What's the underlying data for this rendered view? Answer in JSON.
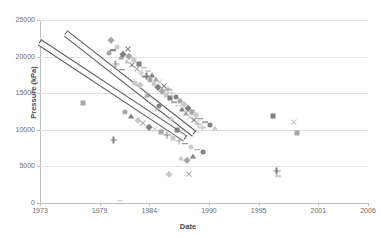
{
  "chart_data": {
    "type": "scatter",
    "title": "",
    "xlabel": "Date",
    "ylabel": "Pressure (kPa)",
    "xlim": [
      1973,
      2006
    ],
    "ylim": [
      0,
      25000
    ],
    "grid": true,
    "legend": "none",
    "x_ticks": [
      "1973",
      "1979",
      "1984",
      "1990",
      "1995",
      "2001",
      "2006"
    ],
    "x_tick_values": [
      1973,
      1979,
      1984,
      1990,
      1995,
      2001,
      2006
    ],
    "y_ticks": [
      "0",
      "5000",
      "10000",
      "15000",
      "20000",
      "25000"
    ],
    "y_tick_values": [
      0,
      5000,
      10000,
      15000,
      20000,
      25000
    ],
    "marker_color_dark": "#808080",
    "marker_color_mid": "#a6a6a6",
    "marker_color_light": "#c9c9c9",
    "trendline_color": "#5a5a5a",
    "gridline_color": "#e2e2e2",
    "trendlines": [
      {
        "name": "upper-trendline",
        "x1": 1975.6,
        "y1": 23300,
        "x2": 1988.5,
        "y2": 9600
      },
      {
        "name": "lower-trendline",
        "x1": 1973.0,
        "y1": 22100,
        "x2": 1987.6,
        "y2": 9000
      }
    ],
    "series": [
      {
        "name": "pressure-observations",
        "points": [
          [
            1977.3,
            13600
          ],
          [
            1980.4,
            8600
          ],
          [
            1981.0,
            300
          ],
          [
            1979.9,
            20500
          ],
          [
            1980.3,
            20900
          ],
          [
            1980.7,
            21300
          ],
          [
            1981.1,
            19900
          ],
          [
            1981.4,
            20400
          ],
          [
            1981.8,
            19400
          ],
          [
            1982.0,
            20100
          ],
          [
            1982.3,
            18800
          ],
          [
            1982.5,
            19500
          ],
          [
            1982.8,
            18300
          ],
          [
            1983.0,
            19000
          ],
          [
            1983.2,
            17800
          ],
          [
            1983.5,
            18500
          ],
          [
            1983.7,
            17300
          ],
          [
            1983.9,
            18000
          ],
          [
            1984.1,
            16800
          ],
          [
            1984.3,
            17500
          ],
          [
            1984.5,
            16300
          ],
          [
            1984.7,
            17000
          ],
          [
            1984.9,
            15800
          ],
          [
            1985.1,
            16500
          ],
          [
            1985.3,
            15300
          ],
          [
            1985.5,
            16000
          ],
          [
            1985.7,
            14800
          ],
          [
            1985.9,
            15500
          ],
          [
            1986.1,
            14300
          ],
          [
            1986.3,
            15000
          ],
          [
            1986.5,
            13800
          ],
          [
            1986.7,
            14500
          ],
          [
            1986.9,
            13300
          ],
          [
            1987.1,
            14000
          ],
          [
            1987.3,
            12800
          ],
          [
            1987.5,
            13500
          ],
          [
            1987.7,
            12300
          ],
          [
            1987.9,
            13000
          ],
          [
            1988.1,
            11800
          ],
          [
            1988.3,
            12500
          ],
          [
            1988.5,
            11300
          ],
          [
            1988.7,
            12000
          ],
          [
            1988.9,
            10800
          ],
          [
            1989.1,
            11500
          ],
          [
            1989.3,
            10300
          ],
          [
            1989.6,
            11000
          ],
          [
            1990.1,
            10600
          ],
          [
            1990.6,
            10200
          ],
          [
            1981.6,
            12400
          ],
          [
            1982.2,
            11900
          ],
          [
            1982.9,
            11300
          ],
          [
            1983.4,
            10900
          ],
          [
            1984.0,
            10400
          ],
          [
            1984.6,
            10100
          ],
          [
            1985.2,
            9700
          ],
          [
            1985.8,
            9300
          ],
          [
            1986.4,
            8900
          ],
          [
            1987.0,
            8500
          ],
          [
            1987.6,
            8100
          ],
          [
            1988.2,
            7700
          ],
          [
            1988.8,
            7300
          ],
          [
            1989.4,
            6900
          ],
          [
            1987.2,
            6200
          ],
          [
            1987.8,
            5900
          ],
          [
            1988.4,
            6400
          ],
          [
            1986.0,
            4000
          ],
          [
            1988.0,
            3900
          ],
          [
            1996.4,
            11900
          ],
          [
            1998.6,
            11100
          ],
          [
            1998.9,
            9600
          ],
          [
            1996.8,
            4400
          ],
          [
            1996.9,
            3700
          ],
          [
            1980.6,
            19000
          ],
          [
            1981.3,
            18200
          ],
          [
            1982.6,
            16400
          ],
          [
            1983.8,
            14700
          ],
          [
            1985.0,
            13200
          ],
          [
            1986.2,
            11600
          ],
          [
            1980.1,
            22300
          ],
          [
            1981.9,
            21000
          ],
          [
            1983.1,
            16100
          ],
          [
            1984.8,
            12900
          ],
          [
            1986.8,
            10000
          ]
        ]
      }
    ]
  }
}
